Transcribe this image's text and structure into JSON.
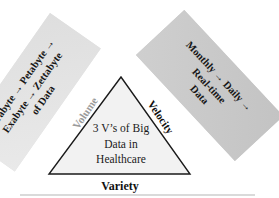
{
  "banners": {
    "volume_banner": {
      "bg": "#e2e2e2",
      "lines": [
        "Terabyte → Petabyte →",
        "Exabyte → Zettabyte",
        "of Data"
      ]
    },
    "velocity_banner": {
      "bg": "#c8c8c8",
      "lines": [
        "Monthly → Daily →",
        "Real-time",
        "Data"
      ]
    }
  },
  "triangle": {
    "fill": "#f2f2f2",
    "stroke": "#1a1a1a",
    "title_lines": [
      "3 V’s of Big",
      "Data in",
      "Healthcare"
    ]
  },
  "axis_labels": {
    "volume": "Volume",
    "velocity": "Velocity",
    "variety": "Variety"
  },
  "colors": {
    "volume_label": "#9b9b9b",
    "label_text": "#111111"
  }
}
